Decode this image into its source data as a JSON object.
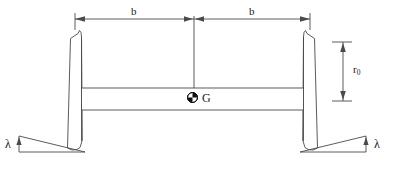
{
  "figure": {
    "background_color": "#ffffff",
    "line_color": "#4a4a4a",
    "text_color": "#1a1a1a"
  },
  "labels": {
    "half_gauge_left": "b",
    "half_gauge_right": "b",
    "centre_of_gravity": "G",
    "rolling_radius_symbol": "r",
    "rolling_radius_subscript": "0",
    "taper_angle_left": "λ",
    "taper_angle_right": "λ"
  },
  "dimensions": {
    "top_dimension": {
      "name": "b",
      "description": "half distance between wheel contact points",
      "segments": 2,
      "left_arrow": "left",
      "right_arrow": "right",
      "centre_arrows": "opposed"
    },
    "vertical_dimension": {
      "name": "r0",
      "description": "nominal rolling radius of wheel",
      "top_arrow": "up",
      "bottom_arrow": "down"
    },
    "angle_left": {
      "name": "lambda",
      "description": "wheel tread conicity angle"
    },
    "angle_right": {
      "name": "lambda",
      "description": "wheel tread conicity angle"
    }
  },
  "components": [
    {
      "name": "left-wheel",
      "interactable": false
    },
    {
      "name": "right-wheel",
      "interactable": false
    },
    {
      "name": "axle",
      "interactable": false
    },
    {
      "name": "centre-of-gravity-marker",
      "interactable": false
    },
    {
      "name": "left-rail-taper-wedge",
      "interactable": false
    },
    {
      "name": "right-rail-taper-wedge",
      "interactable": false
    }
  ]
}
